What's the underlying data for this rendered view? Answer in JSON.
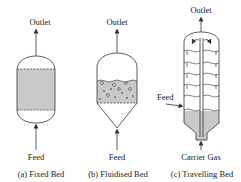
{
  "diagram": {
    "reactors": [
      {
        "id": "fixed-bed",
        "outlet_label": "Outlet",
        "feed_label": "Feed",
        "caption": "(a) Fixed Bed"
      },
      {
        "id": "fluidised-bed",
        "outlet_label": "Outlet",
        "feed_label": "Feed",
        "caption": "(b) Fluidised Bed"
      },
      {
        "id": "travelling-bed",
        "outlet_label": "Outlet",
        "side_feed_label": "Feed",
        "bottom_label": "Carrier Gas",
        "caption": "(c) Travelling Bed"
      }
    ],
    "colors": {
      "line": "#333333",
      "bed_fill": "#c9c9c9",
      "background": "#ffffff"
    }
  }
}
